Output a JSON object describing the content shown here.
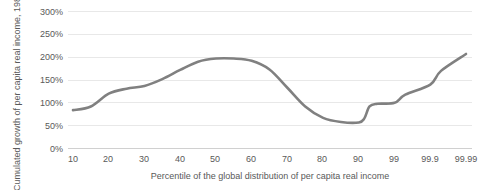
{
  "chart_data": {
    "type": "line",
    "title": "",
    "subtitle": "",
    "xlabel": "Percentile of the global distribution of per capita real income",
    "ylabel": "Cumulated growth of per capita real income, 1980-2020",
    "xtick_labels": [
      "10",
      "20",
      "30",
      "40",
      "50",
      "60",
      "70",
      "80",
      "90",
      "99",
      "99.9",
      "99.99"
    ],
    "ytick_labels": [
      "0%",
      "50%",
      "100%",
      "150%",
      "200%",
      "250%",
      "300%"
    ],
    "ytick_values": [
      0,
      50,
      100,
      150,
      200,
      250,
      300
    ],
    "ylim": [
      0,
      300
    ],
    "grid": true,
    "legend": "none",
    "series": [
      {
        "name": "Cumulated growth",
        "color": "#808080",
        "x": [
          "10",
          "15",
          "20",
          "25",
          "30",
          "35",
          "40",
          "45",
          "50",
          "55",
          "60",
          "65",
          "70",
          "75",
          "80",
          "85",
          "90",
          "93",
          "95",
          "97",
          "99",
          "99.5",
          "99.9",
          "99.95",
          "99.99"
        ],
        "values": [
          84,
          92,
          120,
          131,
          137,
          152,
          172,
          190,
          197,
          197,
          192,
          173,
          133,
          92,
          67,
          58,
          57,
          66,
          92,
          98,
          100,
          118,
          140,
          170,
          207
        ]
      }
    ]
  },
  "axis": {
    "y_title": "Cumulated growth of per capita real income, 1980-2020",
    "x_title": "Percentile of the global distribution of per capita real income"
  },
  "colors": {
    "line": "#808080",
    "gridline": "#e8e8e8",
    "text": "#595959"
  }
}
